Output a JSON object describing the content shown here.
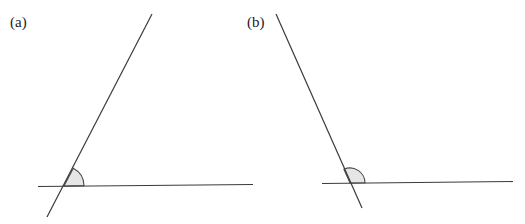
{
  "figure": {
    "panels": [
      {
        "id": "a",
        "label": "(a)",
        "description": "Two lines intersecting; marked angle is acute",
        "marked_angle": "acute",
        "marked_angle_degrees_approx": 62
      },
      {
        "id": "b",
        "label": "(b)",
        "description": "Two lines intersecting; marked angle is obtuse",
        "marked_angle": "obtuse",
        "marked_angle_degrees_approx": 114
      }
    ],
    "colors": {
      "line": "#3a3a3a",
      "angle_fill": "#e6e6e6",
      "text": "#222222"
    }
  }
}
